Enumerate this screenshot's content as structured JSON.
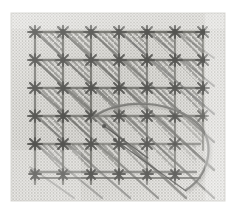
{
  "scene": {
    "subject": "embroidered mesh canvas with diagonal stitch grid",
    "medium": "needlework photograph",
    "tone": "grayscale",
    "width": 233,
    "height": 209
  },
  "colors": {
    "page_background": "#ffffff",
    "canvas_base": "#e9e8e4",
    "canvas_highlight": "#f4f3f0",
    "mesh_dot": "#a9a8a3",
    "mesh_dot_dark": "#8d8c87",
    "thread_dark": "#4a4a48",
    "thread_mid": "#6e6e6b",
    "thread_light": "#8f8f8c",
    "knot_dark": "#3b3b39",
    "loose_thread": "#5e5e5b",
    "fine_thread": "#3a3a38",
    "shadow": "#b6b5b0",
    "edge_fade": "#d8d7d3"
  },
  "canvas_fabric": {
    "left": 11,
    "top": 13,
    "width": 214,
    "height": 188,
    "mesh_pitch": 3.1,
    "mesh_dot_size": 1.5,
    "label": "fine even-weave mesh canvas"
  },
  "stitch_grid": {
    "origin_x": 35,
    "origin_y": 32,
    "cell_size": 28,
    "columns": 7,
    "rows": 6,
    "description": "grid of knotted intersections joined by horizontal and vertical couching threads"
  },
  "knots": {
    "count": 42,
    "radius": 7,
    "arm_count": 6,
    "label": "star-shaped thread knot at each grid intersection"
  },
  "hatching": {
    "direction": "top-left to bottom-right",
    "lines_per_cell": 4,
    "spacing": 6,
    "coverage": "lower-left triangle of each cell",
    "label": "parallel diagonal satin stitches filling each cell"
  },
  "loose_thread_loop": {
    "label": "large slack thread loop arcing over lower-right quadrant",
    "path": "M 92 118 C 120 96, 176 100, 200 126 C 216 146, 208 176, 186 190",
    "stroke_width": 2.2
  },
  "fine_straight_threads": [
    {
      "label": "thin taut thread running down-right from left knot",
      "x1": 104,
      "y1": 126,
      "x2": 148,
      "y2": 158
    },
    {
      "label": "thin taut thread running down-right to lower edge",
      "x1": 115,
      "y1": 140,
      "x2": 186,
      "y2": 191
    }
  ],
  "tonal_regions": [
    {
      "label": "brighter upper-left fabric",
      "shade": "#f2f1ee"
    },
    {
      "label": "shaded central stitch mass",
      "shade": "#d4d3cf"
    },
    {
      "label": "lighter lower-left fabric",
      "shade": "#eceae7"
    },
    {
      "label": "bright right margin fabric",
      "shade": "#f3f2ef"
    }
  ]
}
